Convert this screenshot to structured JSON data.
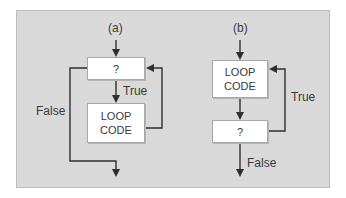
{
  "diagram_a": {
    "title": "(a)",
    "condition_box": "?",
    "loop_box_line1": "LOOP",
    "loop_box_line2": "CODE",
    "true_label": "True",
    "false_label": "False"
  },
  "diagram_b": {
    "title": "(b)",
    "loop_box_line1": "LOOP",
    "loop_box_line2": "CODE",
    "condition_box": "?",
    "true_label": "True",
    "false_label": "False"
  },
  "colors": {
    "panel_bg": "#d9d9d9",
    "box_bg": "#ffffff",
    "line": "#2e2e2e"
  }
}
